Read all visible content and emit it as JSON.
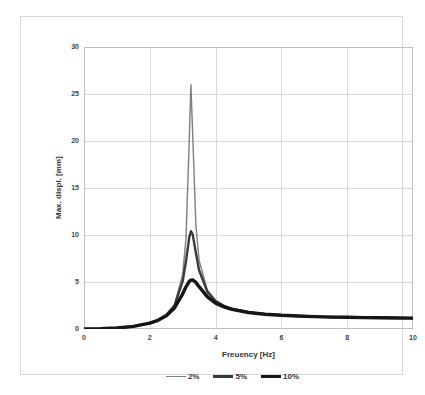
{
  "window": {
    "background": "#ffffff",
    "border_color": "#d9d9d9"
  },
  "chart_data": {
    "type": "line",
    "title": "",
    "xlabel": "Freuency [Hz]",
    "ylabel": "Max. displ. [mm]",
    "xlim": [
      0,
      10
    ],
    "ylim": [
      0,
      30
    ],
    "x_ticks": [
      0,
      2,
      4,
      6,
      8,
      10
    ],
    "y_ticks": [
      0,
      5,
      10,
      15,
      20,
      25,
      30
    ],
    "grid": true,
    "gridline_color": "#d9d9d9",
    "frame_color": "#bfbfbf",
    "text_color": "#3f3f3f",
    "legend_position": "bottom-center",
    "peak_frequency_hz": 3.25,
    "x": [
      0,
      0.5,
      1,
      1.5,
      2,
      2.25,
      2.5,
      2.75,
      3,
      3.1,
      3.2,
      3.25,
      3.3,
      3.4,
      3.5,
      3.75,
      4,
      4.25,
      4.5,
      5,
      5.5,
      6,
      6.5,
      7,
      7.5,
      8,
      8.5,
      9,
      9.5,
      10
    ],
    "series": [
      {
        "name": "2%",
        "color": "#7f7f7f",
        "stroke_width": 1.4,
        "peak_value": 26.0,
        "values": [
          0,
          0.03,
          0.11,
          0.28,
          0.63,
          0.96,
          1.5,
          2.6,
          5.81,
          9.66,
          20.23,
          26.0,
          20.99,
          11.02,
          7.29,
          4.14,
          3.05,
          2.5,
          2.17,
          1.8,
          1.6,
          1.47,
          1.39,
          1.33,
          1.28,
          1.25,
          1.22,
          1.2,
          1.18,
          1.16
        ]
      },
      {
        "name": "5%",
        "color": "#3a3a3a",
        "stroke_width": 2.4,
        "peak_value": 10.4,
        "values": [
          0,
          0.03,
          0.11,
          0.28,
          0.63,
          0.95,
          1.48,
          2.51,
          5.08,
          7.21,
          9.78,
          10.4,
          10.1,
          8.08,
          6.26,
          3.95,
          2.98,
          2.46,
          2.15,
          1.79,
          1.59,
          1.47,
          1.38,
          1.32,
          1.28,
          1.24,
          1.22,
          1.19,
          1.18,
          1.16
        ]
      },
      {
        "name": "10%",
        "color": "#161616",
        "stroke_width": 3.4,
        "peak_value": 5.2,
        "values": [
          0,
          0.03,
          0.11,
          0.28,
          0.62,
          0.93,
          1.41,
          2.25,
          3.75,
          4.49,
          5.06,
          5.2,
          5.22,
          4.96,
          4.5,
          3.43,
          2.76,
          2.35,
          2.08,
          1.76,
          1.57,
          1.46,
          1.38,
          1.32,
          1.27,
          1.24,
          1.21,
          1.19,
          1.17,
          1.16
        ]
      }
    ]
  }
}
